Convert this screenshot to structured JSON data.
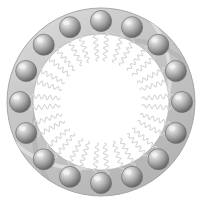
{
  "figure": {
    "canvas": {
      "width": 203,
      "height": 204,
      "background_color": "#ffffff"
    },
    "ring": {
      "name": "lipid-bilayer-band",
      "center_x": 101,
      "center_y": 102,
      "outer_radius": 94,
      "inner_radius": 68,
      "fill_color": "#c2c2c2",
      "edge_highlight_color": "#d9d9d9",
      "edge_shadow_color": "#a6a6a6",
      "outline_color": "#9a9a9a"
    },
    "heads": {
      "name": "lipid-head-group",
      "count": 16,
      "radius": 10.5,
      "orbit_radius": 81,
      "start_angle_deg": -90,
      "highlight_color": "#f2f2f2",
      "mid_color": "#a8a8a8",
      "shadow_color": "#5d5d5d",
      "outline_color": "#6e6e6e",
      "angles_deg": [
        -90,
        -67.5,
        -45,
        -22.5,
        0,
        22.5,
        45,
        67.5,
        90,
        112.5,
        135,
        157.5,
        180,
        202.5,
        225,
        247.5
      ]
    },
    "tails": {
      "name": "lipid-tail",
      "per_head": 2,
      "tails_total": 32,
      "color": "#d6d6d6",
      "stroke_width": 1.1,
      "length": 34,
      "inner_gap_radius": 32,
      "wave_amplitude": 2.6,
      "wave_cycles": 6,
      "angular_offset_deg": 5
    },
    "core": {
      "name": "aqueous-core",
      "radius": 32,
      "fill_color": "#ffffff"
    }
  }
}
